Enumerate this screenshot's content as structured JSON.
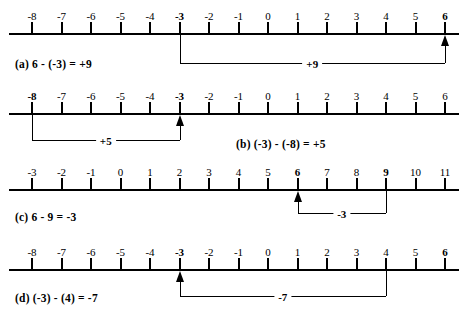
{
  "figure": {
    "type": "number-line-diagram",
    "rows": [
      {
        "id": "a",
        "equation": "(a)  6 - (-3) = +9",
        "axis_y": 33,
        "label_y": 58,
        "numbers": [
          "-8",
          "-7",
          "-6",
          "-5",
          "-4",
          "-3",
          "-2",
          "-1",
          "0",
          "1",
          "2",
          "3",
          "4",
          "5",
          "6"
        ],
        "bold_numbers": [
          "-3",
          "6"
        ],
        "jump": {
          "from": "-3",
          "to": "6",
          "label": "+9",
          "arrow_at": "6",
          "depth": 30,
          "label_side": "center"
        }
      },
      {
        "id": "b",
        "equation": "(b)  (-3) - (-8) = +5",
        "axis_y": 113,
        "label_y": 138,
        "numbers": [
          "-8",
          "-7",
          "-6",
          "-5",
          "-4",
          "-3",
          "-2",
          "-1",
          "0",
          "1",
          "2",
          "3",
          "4",
          "5",
          "6"
        ],
        "bold_numbers": [
          "-8",
          "-3"
        ],
        "jump": {
          "from": "-8",
          "to": "-3",
          "label": "+5",
          "arrow_at": "-3",
          "depth": 27,
          "label_side": "center"
        }
      },
      {
        "id": "c",
        "equation": "(c)  6 - 9 = -3",
        "axis_y": 189,
        "label_y": 211,
        "numbers": [
          "-3",
          "-2",
          "-1",
          "0",
          "1",
          "2",
          "3",
          "4",
          "5",
          "6",
          "7",
          "8",
          "9",
          "10",
          "11"
        ],
        "bold_numbers": [
          "6",
          "9"
        ],
        "jump": {
          "from": "9",
          "to": "6",
          "label": "-3",
          "arrow_at": "6",
          "depth": 24,
          "label_side": "center"
        }
      },
      {
        "id": "d",
        "equation": "(d)  (-3) - (4) = -7",
        "axis_y": 269,
        "label_y": 292,
        "numbers": [
          "-8",
          "-7",
          "-6",
          "-5",
          "-4",
          "-3",
          "-2",
          "-1",
          "0",
          "1",
          "2",
          "3",
          "4",
          "5",
          "6"
        ],
        "bold_numbers": [
          "-3",
          "6"
        ],
        "jump": {
          "from": "4",
          "to": "-3",
          "label": "-7",
          "arrow_at": "-3",
          "depth": 27,
          "label_side": "center"
        }
      }
    ],
    "geometry": {
      "first_tick_x": 32,
      "tick_spacing": 29.5,
      "axis_left": 9,
      "axis_right": 459,
      "tick_height": 11,
      "number_label_offset": 16
    },
    "colors": {
      "ink": "#000000",
      "background": "#ffffff"
    }
  }
}
